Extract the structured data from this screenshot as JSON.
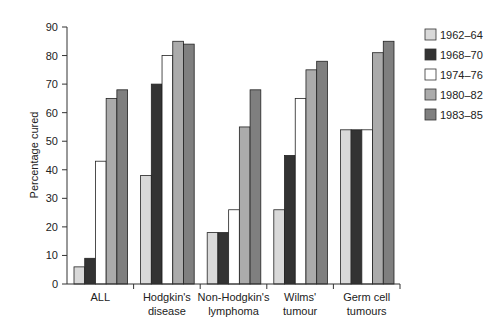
{
  "chart_data": {
    "type": "bar",
    "title": "",
    "xlabel": "",
    "ylabel": "Percentage cured",
    "ylim": [
      0,
      90
    ],
    "yticks": [
      0,
      10,
      20,
      30,
      40,
      50,
      60,
      70,
      80,
      90
    ],
    "grid": false,
    "legend_position": "right",
    "categories": [
      [
        "ALL"
      ],
      [
        "Hodgkin's",
        "disease"
      ],
      [
        "Non-Hodgkin's",
        "lymphoma"
      ],
      [
        "Wilms'",
        "tumour"
      ],
      [
        "Germ cell",
        "tumours"
      ]
    ],
    "series": [
      {
        "name": "1962–64",
        "color": "#d9d9d9",
        "values": [
          6,
          38,
          18,
          26,
          54
        ]
      },
      {
        "name": "1968–70",
        "color": "#333333",
        "values": [
          9,
          70,
          18,
          45,
          54
        ]
      },
      {
        "name": "1974–76",
        "color": "#ffffff",
        "values": [
          43,
          80,
          26,
          65,
          54
        ]
      },
      {
        "name": "1980–82",
        "color": "#ababab",
        "values": [
          65,
          85,
          55,
          75,
          81
        ]
      },
      {
        "name": "1983–85",
        "color": "#7f7f7f",
        "values": [
          68,
          84,
          68,
          78,
          85
        ]
      }
    ]
  }
}
